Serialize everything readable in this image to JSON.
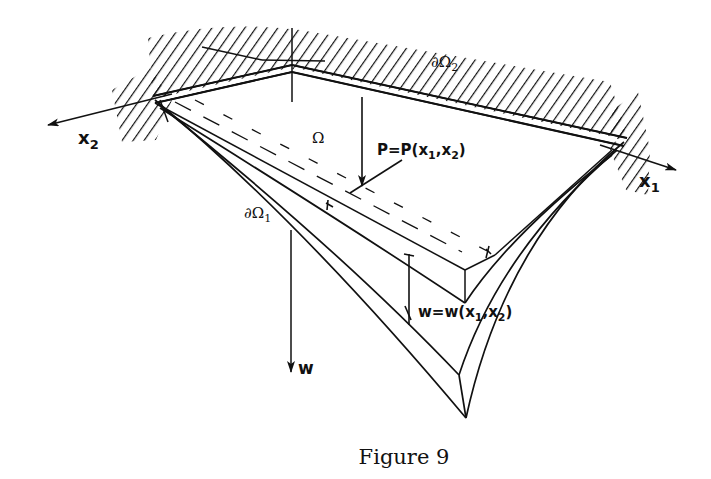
{
  "figure": {
    "caption": "Figure 9",
    "labels": {
      "axis_x1": "x",
      "axis_x1_sub": "1",
      "axis_x2": "x",
      "axis_x2_sub": "2",
      "axis_w": "w",
      "domain": "Ω",
      "boundary_1": "∂Ω",
      "boundary_1_sub": "1",
      "boundary_2": "∂Ω",
      "boundary_2_sub": "2",
      "load": "P=P(x",
      "load_sub1": "1",
      "load_mid": ",x",
      "load_sub2": "2",
      "load_end": ")",
      "deflection": "w=w(x",
      "deflection_sub1": "1",
      "deflection_mid": ",x",
      "deflection_sub2": "2",
      "deflection_end": ")"
    },
    "colors": {
      "ink": "#111111",
      "background": "#ffffff"
    }
  }
}
